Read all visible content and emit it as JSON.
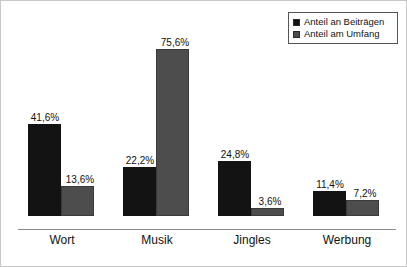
{
  "chart_data": {
    "type": "bar",
    "title": "",
    "subtitle": "",
    "xlabel": "",
    "ylabel": "",
    "ylim": [
      0,
      80
    ],
    "grid": false,
    "legend_position": "top-right",
    "value_labels_shown": true,
    "value_suffix": "%",
    "decimal_separator": ",",
    "categories": [
      "Wort",
      "Musik",
      "Jingles",
      "Werbung"
    ],
    "series": [
      {
        "name": "Anteil an Beiträgen",
        "color": "#131313",
        "values": [
          41.6,
          22.2,
          24.8,
          11.4
        ],
        "labels": [
          "41,6%",
          "22,2%",
          "24,8%",
          "11,4%"
        ]
      },
      {
        "name": "Anteil am Umfang",
        "color": "#4d4d4d",
        "values": [
          13.6,
          75.6,
          3.6,
          7.2
        ],
        "labels": [
          "13,6%",
          "75,6%",
          "3,6%",
          "7,2%"
        ]
      }
    ]
  },
  "legend": {
    "items": [
      {
        "label": "Anteil an Beiträgen",
        "color": "#131313"
      },
      {
        "label": "Anteil am Umfang",
        "color": "#4d4d4d"
      }
    ]
  },
  "axis": {
    "categories": [
      "Wort",
      "Musik",
      "Jingles",
      "Werbung"
    ]
  },
  "colors": {
    "series_black": "#131313",
    "series_gray": "#4d4d4d",
    "frame": "#c8c8c8",
    "baseline": "#8d8d8d",
    "text": "#111111"
  }
}
